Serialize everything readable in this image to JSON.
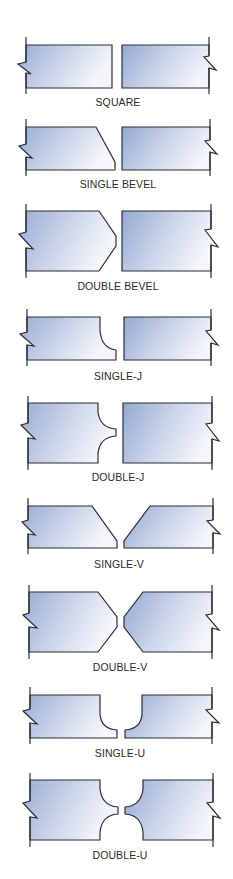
{
  "figure": {
    "joints": [
      {
        "id": "square",
        "label": "SQUARE"
      },
      {
        "id": "single-bevel",
        "label": "SINGLE BEVEL"
      },
      {
        "id": "double-bevel",
        "label": "DOUBLE BEVEL"
      },
      {
        "id": "single-j",
        "label": "SINGLE-J"
      },
      {
        "id": "double-j",
        "label": "DOUBLE-J"
      },
      {
        "id": "single-v",
        "label": "SINGLE-V"
      },
      {
        "id": "double-v",
        "label": "DOUBLE-V"
      },
      {
        "id": "single-u",
        "label": "SINGLE-U"
      },
      {
        "id": "double-u",
        "label": "DOUBLE-U"
      }
    ]
  },
  "colors": {
    "plate_gradient_start": "#9aacd2",
    "plate_gradient_end": "#f4f6fa",
    "outline": "#2b2d33",
    "label_text": "#2a2a2a",
    "background": "#ffffff"
  }
}
